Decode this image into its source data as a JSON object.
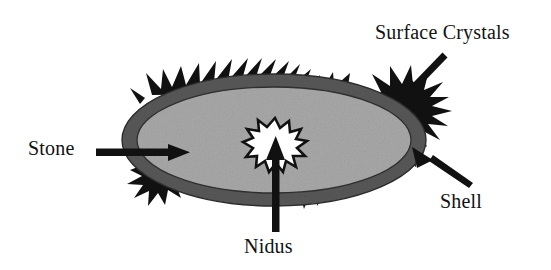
{
  "diagram": {
    "type": "anatomical-cross-section",
    "labels": {
      "surface_crystals": "Surface Crystals",
      "stone": "Stone",
      "shell": "Shell",
      "nidus": "Nidus"
    },
    "colors": {
      "background": "#ffffff",
      "shell_ring": "#575757",
      "stone_interior": "#a9a9a9",
      "crystal_spikes": "#111111",
      "nidus_fill": "#ffffff",
      "nidus_outline": "#111111",
      "arrow": "#111111",
      "text": "#121212"
    },
    "parts": [
      {
        "name": "surface-crystals",
        "label": "Surface Crystals",
        "description": "black spiky crystals protruding from the outer edge"
      },
      {
        "name": "stone",
        "label": "Stone",
        "description": "the whole elliptical concretion"
      },
      {
        "name": "shell",
        "label": "Shell",
        "description": "dark gray outer ring"
      },
      {
        "name": "nidus",
        "label": "Nidus",
        "description": "white star-burst core at the center"
      }
    ],
    "arrows": [
      {
        "name": "surface-crystals-arrow",
        "from": [
          443,
          70
        ],
        "to": [
          403,
          104
        ],
        "direction": "down-left"
      },
      {
        "name": "stone-arrow",
        "from": [
          96,
          152
        ],
        "to": [
          185,
          152
        ],
        "direction": "right"
      },
      {
        "name": "shell-arrow",
        "from": [
          462,
          190
        ],
        "to": [
          414,
          160
        ],
        "direction": "up-left"
      },
      {
        "name": "nidus-arrow",
        "from": [
          276,
          232
        ],
        "to": [
          276,
          145
        ],
        "direction": "up"
      }
    ]
  }
}
